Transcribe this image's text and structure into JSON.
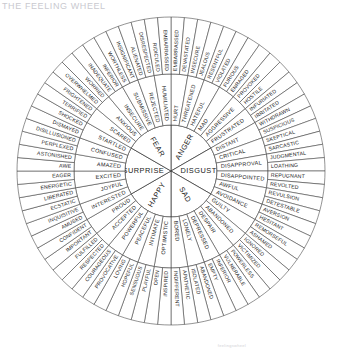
{
  "title": "THE FEELING WHEEL",
  "credit": "feelingswheel",
  "colors": {
    "stroke": "#3a3a3a",
    "background": "#ffffff",
    "text": "#1a1a1a",
    "title": "#c9c9cf"
  },
  "chart_data": {
    "type": "pie",
    "title": "THE FEELING WHEEL",
    "rings": [
      "core",
      "middle",
      "outer"
    ],
    "core_count": 6,
    "middle_count": 36,
    "outer_count": 72
  },
  "wheel": {
    "core": [
      {
        "label": "ANGER",
        "start": -90,
        "end": -30
      },
      {
        "label": "DISGUST",
        "start": -30,
        "end": 30
      },
      {
        "label": "SAD",
        "start": 30,
        "end": 90
      },
      {
        "label": "HAPPY",
        "start": 90,
        "end": 150
      },
      {
        "label": "SURPRISE",
        "start": 150,
        "end": 210
      },
      {
        "label": "FEAR",
        "start": 210,
        "end": 270
      }
    ],
    "middle": [
      "MAD",
      "AGGRESSIVE",
      "FRUSTRATED",
      "DISTANT",
      "CRITICAL",
      "DISAPPROVAL",
      "DISAPPOINTED",
      "AWFUL",
      "AVOIDANCE",
      "GUILTY",
      "ABANDONED",
      "DESPAIR",
      "DEPRESSED",
      "LONELY",
      "BORED",
      "OPTIMISTIC",
      "INTIMATE",
      "PEACEFUL",
      "POWERFUL",
      "ACCEPTED",
      "PROUD",
      "INTERESTED",
      "JOYFUL",
      "EXCITED",
      "AMAZED",
      "CONFUSED",
      "STARTLED",
      "SCARED",
      "ANXIOUS",
      "INSECURE",
      "SUBMISSIVE",
      "REJECTED",
      "HUMILIATED",
      "HATEFUL",
      "THREATENED"
    ],
    "middle_full": [
      "MAD",
      "AGGRESSIVE",
      "FRUSTRATED",
      "DISTANT",
      "CRITICAL",
      "DISAPPROVAL",
      "DISAPPOINTED",
      "AWFUL",
      "AVOIDANCE",
      "GUILTY",
      "ABANDONED",
      "DESPAIR",
      "DEPRESSED",
      "LONELY",
      "BORED",
      "OPTIMISTIC",
      "INTIMATE",
      "PEACEFUL",
      "POWERFUL",
      "ACCEPTED",
      "PROUD",
      "INTERESTED",
      "JOYFUL",
      "EXCITED",
      "AMAZED",
      "CONFUSED",
      "STARTLED",
      "SCARED",
      "ANXIOUS",
      "INSECURE",
      "SUBMISSIVE",
      "REJECTED",
      "HUMILIATED",
      "HATEFUL",
      "THREATENED",
      "MAD2"
    ],
    "middle_ring": [
      "HURT",
      "THREATENED",
      "HATEFUL",
      "MAD",
      "AGGRESSIVE",
      "FRUSTRATED",
      "DISTANT",
      "CRITICAL",
      "DISAPPROVAL",
      "DISAPPOINTED",
      "AWFUL",
      "AVOIDANCE",
      "GUILTY",
      "ABANDONED",
      "DESPAIR",
      "DEPRESSED",
      "LONELY",
      "BORED",
      "OPTIMISTIC",
      "INTIMATE",
      "PEACEFUL",
      "POWERFUL",
      "ACCEPTED",
      "PROUD",
      "INTERESTED",
      "JOYFUL",
      "EXCITED",
      "AMAZED",
      "CONFUSED",
      "STARTLED",
      "SCARED",
      "ANXIOUS",
      "INSECURE",
      "SUBMISSIVE",
      "REJECTED",
      "HUMILIATED"
    ],
    "outer_ring": [
      "EMBARRASSED",
      "DEVASTATED",
      "INSECURE",
      "JEALOUS",
      "RESENTFUL",
      "VIOLATED",
      "FURIOUS",
      "ENRAGED",
      "PROVOKED",
      "HOSTILE",
      "INFURIATED",
      "IRRITATED",
      "WITHDRAWN",
      "SUSPICIOUS",
      "SKEPTICAL",
      "SARCASTIC",
      "JUDGMENTAL",
      "LOATHING",
      "REPUGNANT",
      "REVOLTED",
      "REVULSION",
      "DETESTABLE",
      "AVERSION",
      "HESITANT",
      "REMORSEFUL",
      "ASHAMED",
      "IGNORED",
      "VICTIMIZED",
      "POWERLESS",
      "VULNERABLE",
      "INFERIOR",
      "EMPTY",
      "ABANDONED",
      "ISOLATED",
      "APATHETIC",
      "INDIFFERENT",
      "INSPIRED",
      "OPEN",
      "PLAYFUL",
      "SENSUOUS",
      "HOPEFUL",
      "LOVING",
      "PROVOCATIVE",
      "COURAGEOUS",
      "RESPECTED",
      "FULFILLED",
      "IMPORTANT",
      "CONFIDENT",
      "AMUSED",
      "INQUISITIVE",
      "ECSTATIC",
      "LIBERATED",
      "ENERGETIC",
      "EAGER",
      "AWE",
      "ASTONISHED",
      "PERPLEXED",
      "DISILLUSIONED",
      "DISMAYED",
      "SHOCKED",
      "TERRIFIED",
      "FRIGHTENED",
      "OVERWHELMED",
      "WORRIED",
      "INADEQUATE",
      "INFERIOR",
      "WORTHLESS",
      "INSIGNIFICANT",
      "ALIENATED",
      "DISRESPECTED",
      "RIDICULED",
      "EMBARRASSED"
    ]
  }
}
